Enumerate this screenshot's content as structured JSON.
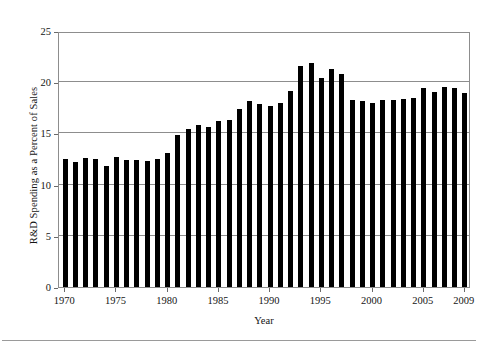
{
  "chart_data": {
    "type": "bar",
    "title": "",
    "xlabel": "Year",
    "ylabel": "R&D Spending as a Percent of Sales",
    "xlim": [
      1969.4,
      2009.6
    ],
    "ylim": [
      0,
      25
    ],
    "ytick_labels": [
      "0",
      "5",
      "10",
      "15",
      "20",
      "25"
    ],
    "ytick_values": [
      0,
      5,
      10,
      15,
      20,
      25
    ],
    "xtick_labels": [
      "1970",
      "1975",
      "1980",
      "1985",
      "1990",
      "1995",
      "2000",
      "2005",
      "2009"
    ],
    "xtick_values": [
      1970,
      1975,
      1980,
      1985,
      1990,
      1995,
      2000,
      2005,
      2009
    ],
    "grid": "horizontal",
    "legend": "none",
    "bar_color": "#000000",
    "grid_color": "#8d8d8d",
    "categories": [
      "1970",
      "1971",
      "1972",
      "1973",
      "1974",
      "1975",
      "1976",
      "1977",
      "1978",
      "1979",
      "1980",
      "1981",
      "1982",
      "1983",
      "1984",
      "1985",
      "1986",
      "1987",
      "1988",
      "1989",
      "1990",
      "1991",
      "1992",
      "1993",
      "1994",
      "1995",
      "1996",
      "1997",
      "1998",
      "1999",
      "2000",
      "2001",
      "2002",
      "2003",
      "2004",
      "2005",
      "2006",
      "2007",
      "2008",
      "2009"
    ],
    "values": [
      12.5,
      12.2,
      12.6,
      12.5,
      11.8,
      12.7,
      12.4,
      12.4,
      12.3,
      12.5,
      13.1,
      14.8,
      15.4,
      15.8,
      15.6,
      16.2,
      16.3,
      17.4,
      18.2,
      17.9,
      17.7,
      18.0,
      19.1,
      21.6,
      21.9,
      20.4,
      21.3,
      20.8,
      18.3,
      18.2,
      18.0,
      18.3,
      18.3,
      18.4,
      18.5,
      19.4,
      19.0,
      19.5,
      19.4,
      18.9
    ]
  }
}
